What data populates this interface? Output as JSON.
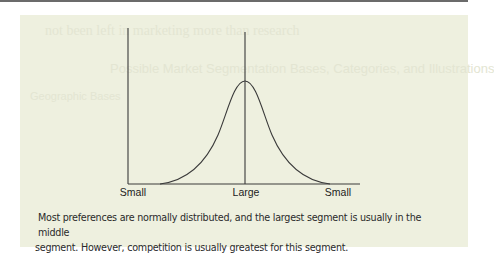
{
  "figure": {
    "type": "normal-distribution-diagram",
    "axis": {
      "x_labels": [
        "Small",
        "Large",
        "Small"
      ]
    },
    "curve": {
      "shape": "bell-curve",
      "peak_position": "center",
      "center_marker": true
    },
    "caption": {
      "line1": "Most preferences are normally distributed, and the largest segment is usually in the middle",
      "line2": "segment. However, competition is usually greatest for this segment."
    },
    "background_bleed_text": {
      "line1": "not been left in marketing more than research",
      "line2": "Possible Market Segmentation Bases, Categories, and Illustrations",
      "line3": "Geographic Bases"
    },
    "colors": {
      "panel_background": "#eef0df",
      "line_color": "#3a3a3a",
      "text_color": "#222222",
      "top_rule": "#6b6b6b"
    }
  }
}
